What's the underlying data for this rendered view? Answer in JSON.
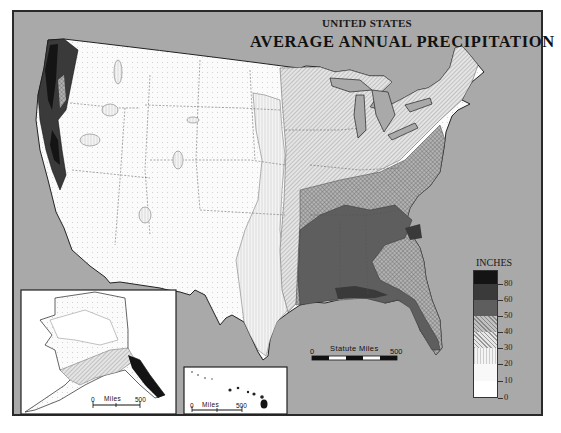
{
  "title": {
    "line1": "UNITED STATES",
    "line2": "AVERAGE ANNUAL PRECIPITATION"
  },
  "legend": {
    "title": "INCHES",
    "classes": [
      {
        "label": "80",
        "pattern": "black",
        "color": "#141414"
      },
      {
        "label": "60",
        "pattern": "very-dark-gray",
        "color": "#3a3a3a"
      },
      {
        "label": "50",
        "pattern": "dark-gray",
        "color": "#5e5e5e"
      },
      {
        "label": "40",
        "pattern": "cross-hatch",
        "color": "#9a9a9a"
      },
      {
        "label": "30",
        "pattern": "diagonal-hatch",
        "color": "#cfcfcf"
      },
      {
        "label": "20",
        "pattern": "vertical-lines",
        "color": "#ebebeb"
      },
      {
        "label": "10",
        "pattern": "dots",
        "color": "#f6f6f6"
      },
      {
        "label": "0",
        "pattern": "white",
        "color": "#ffffff"
      }
    ]
  },
  "scale_bar": {
    "title": "Statute Miles",
    "start": "0",
    "end": "500"
  },
  "insets": {
    "alaska": {
      "scale_title": "Miles",
      "start": "0",
      "end": "500"
    },
    "hawaii": {
      "scale_title": "Miles",
      "start": "0",
      "end": "500"
    }
  },
  "colors": {
    "background": "#a9a9a9",
    "frame": "#2a2a2a",
    "land_dry": "#ffffff",
    "land_wettest": "#141414"
  }
}
